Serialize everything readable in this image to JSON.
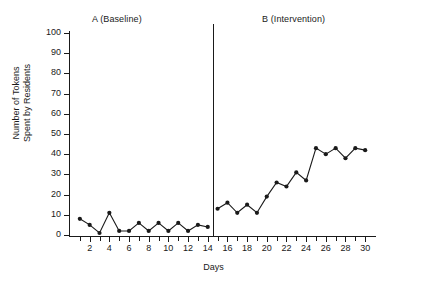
{
  "figure": {
    "phase_a_label": "A (Baseline)",
    "phase_b_label": "B (Intervention)",
    "ylabel_line1": "Number of Tokens",
    "ylabel_line2": "Spent by Residents",
    "xlabel": "Days"
  },
  "chart_data": {
    "type": "line",
    "title": "",
    "xlabel": "Days",
    "ylabel": "Number of Tokens Spent by Residents",
    "xlim": [
      0,
      31
    ],
    "ylim": [
      0,
      100
    ],
    "ytick_labels": [
      "0",
      "10",
      "20",
      "30",
      "40",
      "50",
      "60",
      "70",
      "80",
      "90",
      "100"
    ],
    "ytick_values": [
      0,
      10,
      20,
      30,
      40,
      50,
      60,
      70,
      80,
      90,
      100
    ],
    "xtick_labels": [
      "2",
      "4",
      "6",
      "8",
      "10",
      "12",
      "14",
      "16",
      "18",
      "20",
      "22",
      "24",
      "26",
      "28",
      "30"
    ],
    "xtick_values": [
      2,
      4,
      6,
      8,
      10,
      12,
      14,
      16,
      18,
      20,
      22,
      24,
      26,
      28,
      30
    ],
    "xtick_minor_values": [
      1,
      3,
      5,
      7,
      9,
      11,
      13,
      15,
      17,
      19,
      21,
      23,
      25,
      27,
      29
    ],
    "grid": false,
    "legend": false,
    "marker": "filled-circle",
    "line_color": "#1a1a1a",
    "phase_divider_x": 14.5,
    "annotations": [
      {
        "text": "A (Baseline)",
        "x": 7,
        "position": "top"
      },
      {
        "text": "B (Intervention)",
        "x": 22,
        "position": "top"
      }
    ],
    "series": [
      {
        "name": "A (Baseline)",
        "x": [
          1,
          2,
          3,
          4,
          5,
          6,
          7,
          8,
          9,
          10,
          11,
          12,
          13,
          14
        ],
        "values": [
          8,
          5,
          1,
          11,
          2,
          2,
          6,
          2,
          6,
          2,
          6,
          2,
          5,
          4
        ]
      },
      {
        "name": "B (Intervention)",
        "x": [
          15,
          16,
          17,
          18,
          19,
          20,
          21,
          22,
          23,
          24,
          25,
          26,
          27,
          28,
          29,
          30
        ],
        "values": [
          13,
          16,
          11,
          15,
          11,
          19,
          26,
          24,
          31,
          27,
          43,
          40,
          43,
          38,
          43,
          42
        ]
      }
    ]
  }
}
